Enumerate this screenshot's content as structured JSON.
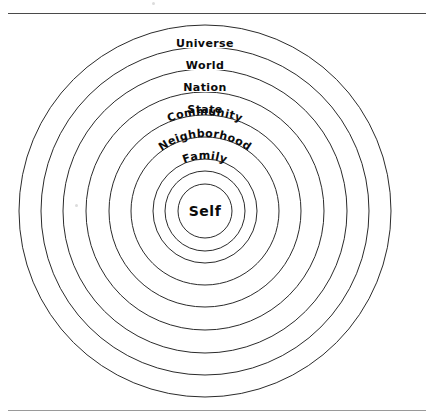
{
  "page": {
    "background_color": "#ffffff",
    "stroke_color": "#2b2b2b",
    "text_color": "#0b0b0b",
    "rule_top_color": "#4a4a4a",
    "rule_bottom_color": "#9a9a9a"
  },
  "diagram": {
    "type": "concentric-circles",
    "title": "",
    "center": {
      "x": 205,
      "y": 211
    },
    "center_label": "Self",
    "rings": [
      {
        "label": "Universe",
        "radius": 186,
        "label_y": 43,
        "curved": false,
        "font_size": 11
      },
      {
        "label": "World",
        "radius": 164,
        "label_y": 64,
        "curved": false,
        "font_size": 11
      },
      {
        "label": "Nation",
        "radius": 142,
        "label_y": 86,
        "curved": false,
        "font_size": 11
      },
      {
        "label": "State",
        "radius": 119,
        "label_y": 108,
        "curved": false,
        "font_size": 11
      },
      {
        "label": "Community",
        "radius": 96,
        "label_y": 133,
        "curved": true,
        "font_size": 11
      },
      {
        "label": "Neighborhood",
        "radius": 74,
        "label_y": 157,
        "curved": true,
        "font_size": 11
      },
      {
        "label": "Family",
        "radius": 52,
        "label_y": 179,
        "curved": true,
        "font_size": 11
      },
      {
        "label": "",
        "radius": 40,
        "label_y": 0,
        "curved": false,
        "font_size": 0
      },
      {
        "label": "",
        "radius": 27,
        "label_y": 0,
        "curved": false,
        "font_size": 0
      }
    ]
  },
  "labels": {
    "universe": "Universe",
    "world": "World",
    "nation": "Nation",
    "state": "State",
    "community": "Community",
    "neighborhood": "Neighborhood",
    "family": "Family",
    "self": "Self"
  }
}
